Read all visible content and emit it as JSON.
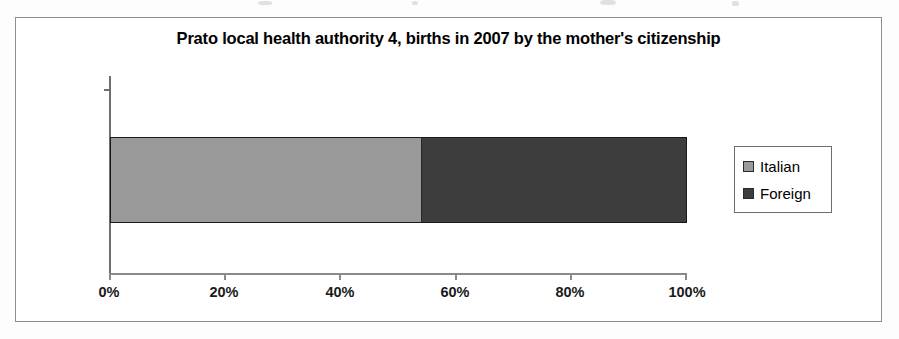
{
  "chart_data": {
    "type": "bar",
    "orientation": "horizontal",
    "stacked": true,
    "normalized": true,
    "title": "Prato local health authority 4, births in 2007 by the mother's citizenship",
    "xlabel": "",
    "ylabel": "",
    "categories": [
      "Births in 2007"
    ],
    "series": [
      {
        "name": "Italian",
        "values": [
          54
        ],
        "color": "#9a9a9a"
      },
      {
        "name": "Foreign",
        "values": [
          46
        ],
        "color": "#3d3d3d"
      }
    ],
    "xlim": [
      0,
      100
    ],
    "xticks": [
      0,
      20,
      40,
      60,
      80,
      100
    ],
    "xtick_labels": [
      "0%",
      "20%",
      "40%",
      "60%",
      "80%",
      "100%"
    ],
    "grid": false,
    "legend_position": "right",
    "legend_entries": [
      {
        "label": "Italian",
        "color": "#9a9a9a"
      },
      {
        "label": "Foreign",
        "color": "#3d3d3d"
      }
    ],
    "value_unit": "%"
  },
  "colors": {
    "italian": "#9a9a9a",
    "foreign": "#3d3d3d",
    "axis": "#8a8a8a",
    "frame": "#8d8d8d",
    "text": "#000000"
  }
}
